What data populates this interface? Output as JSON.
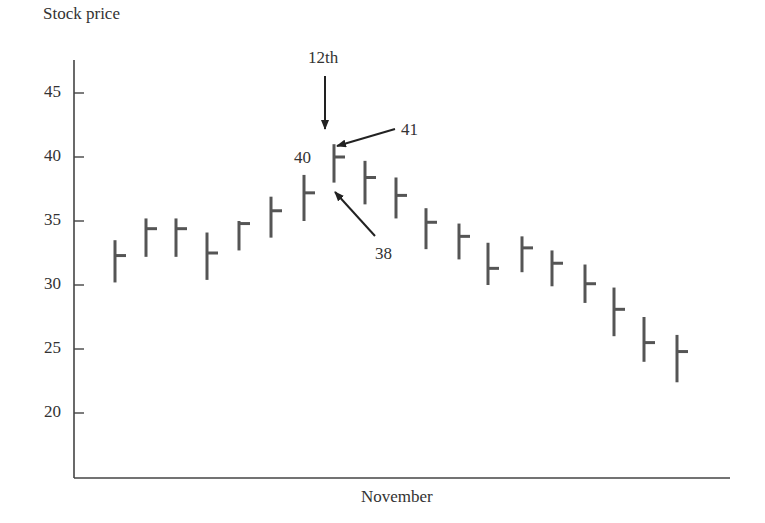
{
  "chart_data": {
    "type": "ohlc-bar",
    "title": "",
    "ylabel": "Stock price",
    "xlabel": "November",
    "ylim": [
      15,
      47
    ],
    "yticks": [
      20,
      25,
      30,
      35,
      40,
      45
    ],
    "grid": false,
    "legend": null,
    "series": [
      {
        "name": "Stock price",
        "bars": [
          {
            "high": 33.5,
            "low": 30.2,
            "close": 32.3
          },
          {
            "high": 35.2,
            "low": 32.2,
            "close": 34.4
          },
          {
            "high": 35.2,
            "low": 32.2,
            "close": 34.4
          },
          {
            "high": 34.1,
            "low": 30.4,
            "close": 32.5
          },
          {
            "high": 35.0,
            "low": 32.7,
            "close": 34.8
          },
          {
            "high": 36.9,
            "low": 33.7,
            "close": 35.8
          },
          {
            "high": 38.6,
            "low": 35.0,
            "close": 37.2
          },
          {
            "high": 41.0,
            "low": 38.0,
            "close": 40.0
          },
          {
            "high": 39.7,
            "low": 36.3,
            "close": 38.4
          },
          {
            "high": 38.4,
            "low": 35.2,
            "close": 37.0
          },
          {
            "high": 36.0,
            "low": 32.8,
            "close": 34.9
          },
          {
            "high": 34.8,
            "low": 32.0,
            "close": 33.8
          },
          {
            "high": 33.3,
            "low": 30.0,
            "close": 31.3
          },
          {
            "high": 33.8,
            "low": 31.0,
            "close": 32.9
          },
          {
            "high": 32.7,
            "low": 29.9,
            "close": 31.7
          },
          {
            "high": 31.6,
            "low": 28.6,
            "close": 30.1
          },
          {
            "high": 29.8,
            "low": 26.0,
            "close": 28.1
          },
          {
            "high": 27.5,
            "low": 24.0,
            "close": 25.5
          },
          {
            "high": 26.1,
            "low": 22.4,
            "close": 24.8
          }
        ]
      }
    ],
    "annotations": [
      {
        "text": "12th",
        "target": "bar-8",
        "arrow": "down",
        "meaning": "date of highlighted bar"
      },
      {
        "text": "41",
        "target": "bar-8-high",
        "arrow": "left-down"
      },
      {
        "text": "40",
        "target": "bar-8-close",
        "arrow": "none"
      },
      {
        "text": "38",
        "target": "bar-8-low",
        "arrow": "up-left"
      }
    ],
    "colors": {
      "bar": "#555555",
      "axis": "#444444",
      "text": "#333333"
    }
  },
  "labels": {
    "ylabel": "Stock price",
    "xlabel": "November",
    "ann_date": "12th",
    "ann_high": "41",
    "ann_close": "40",
    "ann_low": "38"
  }
}
